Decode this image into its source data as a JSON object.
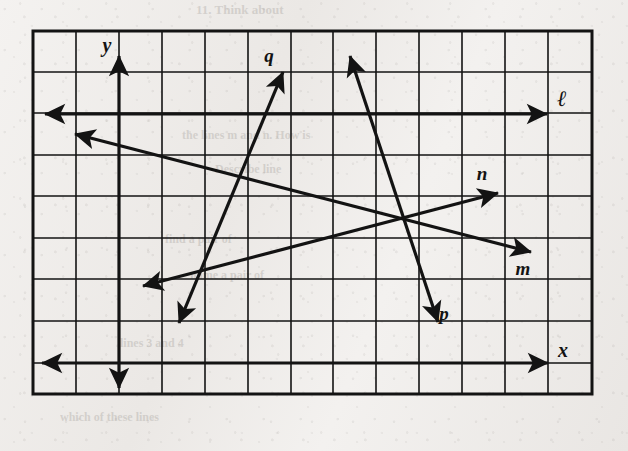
{
  "figure": {
    "type": "coordinate-grid-lines-diagram",
    "background_color": "#f0eeec",
    "ink_color": "#131313"
  },
  "grid": {
    "left": 33,
    "top": 31,
    "right": 592,
    "bottom": 394,
    "columns": 13,
    "rows": 9,
    "cell_width": 43,
    "cell_height": 41.5,
    "border_width": 3,
    "line_width": 1.6,
    "x_lines": [
      33,
      76,
      119,
      162,
      205,
      248,
      291,
      333,
      376,
      419,
      462,
      505,
      548,
      592
    ],
    "y_lines": [
      31,
      72,
      113,
      155,
      196,
      238,
      279,
      321,
      363,
      394
    ]
  },
  "axes": [
    {
      "name": "y-axis",
      "label": "y",
      "orientation": "vertical",
      "x": 119,
      "y_start": 56,
      "y_end": 388,
      "label_x": 107,
      "label_y": 52
    },
    {
      "name": "x-axis",
      "label": "x",
      "orientation": "horizontal",
      "y": 363,
      "x_start": 42,
      "x_end": 548,
      "label_x": 563,
      "label_y": 357
    }
  ],
  "lines": [
    {
      "name": "line-l",
      "label": "ℓ",
      "x1": 45,
      "y1": 114,
      "x2": 547,
      "y2": 114,
      "label_x": 562,
      "label_y": 106,
      "label_size": 22
    },
    {
      "name": "line-m",
      "label": "m",
      "x1": 75,
      "y1": 134,
      "x2": 531,
      "y2": 252,
      "label_x": 523,
      "label_y": 275,
      "label_size": 19
    },
    {
      "name": "line-n",
      "label": "n",
      "x1": 143,
      "y1": 286,
      "x2": 498,
      "y2": 193,
      "label_x": 482,
      "label_y": 180,
      "label_size": 19
    },
    {
      "name": "line-q",
      "label": "q",
      "x1": 179,
      "y1": 323,
      "x2": 283,
      "y2": 72,
      "label_x": 269,
      "label_y": 62,
      "label_size": 19
    },
    {
      "name": "line-p",
      "label": "p",
      "x1": 350,
      "y1": 56,
      "x2": 438,
      "y2": 322,
      "label_x": 444,
      "label_y": 320,
      "label_size": 19
    }
  ],
  "ghost_text": [
    {
      "text": "11. Think about",
      "x": 196,
      "y": 2,
      "size": 13
    },
    {
      "text": "the lines m and n. How is",
      "x": 182,
      "y": 128,
      "size": 12
    },
    {
      "text": "Describe line",
      "x": 215,
      "y": 162,
      "size": 12
    },
    {
      "text": "find a pair of",
      "x": 165,
      "y": 232,
      "size": 12
    },
    {
      "text": "name a pair of",
      "x": 190,
      "y": 268,
      "size": 12
    },
    {
      "text": "lines 3 and 4",
      "x": 120,
      "y": 336,
      "size": 12
    },
    {
      "text": "which of these lines",
      "x": 60,
      "y": 410,
      "size": 12
    }
  ]
}
